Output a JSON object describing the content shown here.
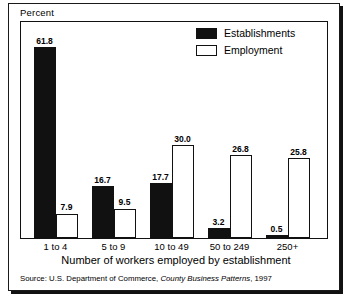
{
  "chart_data": {
    "type": "bar",
    "title": "",
    "ylabel": "Percent",
    "xlabel": "Number of workers employed by establishment",
    "categories": [
      "1 to 4",
      "5 to 9",
      "10 to 49",
      "50 to 249",
      "250+"
    ],
    "series": [
      {
        "name": "Establishments",
        "values": [
          61.8,
          16.7,
          17.7,
          3.2,
          0.5
        ],
        "color": "#111111",
        "fill": "solid"
      },
      {
        "name": "Employment",
        "values": [
          7.9,
          9.5,
          30.0,
          26.8,
          25.8
        ],
        "color": "#ffffff",
        "fill": "hollow"
      }
    ],
    "value_labels": [
      [
        "61.8",
        "7.9"
      ],
      [
        "16.7",
        "9.5"
      ],
      [
        "17.7",
        "30.0"
      ],
      [
        "3.2",
        "26.8"
      ],
      [
        "0.5",
        "25.8"
      ]
    ],
    "ylim": [
      0,
      61.8
    ],
    "grid": false,
    "legend_position": "top-right"
  },
  "legend": {
    "items": [
      {
        "label": "Establishments",
        "style": "filled"
      },
      {
        "label": "Employment",
        "style": "hollow"
      }
    ]
  },
  "source": {
    "prefix": "Source: U.S. Department of Commerce, ",
    "publication": "County Business Patterns",
    "suffix": ", 1997"
  }
}
